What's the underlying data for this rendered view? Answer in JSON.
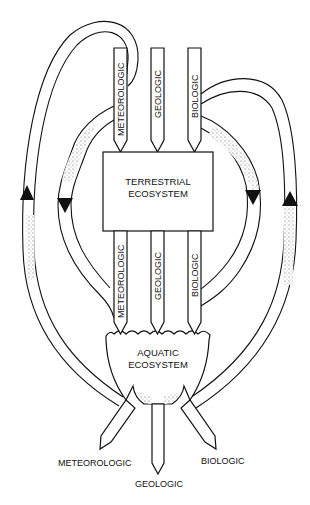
{
  "diagram": {
    "type": "ecosystem-flow-diagram",
    "colors": {
      "line": "#111111",
      "background": "#ffffff",
      "stipple": "#555555"
    },
    "terrestrial": {
      "label_line1": "TERRESTRIAL",
      "label_line2": "ECOSYSTEM",
      "inputs": [
        "METEOROLOGIC",
        "GEOLOGIC",
        "BIOLOGIC"
      ],
      "outputs": [
        "METEOROLOGIC",
        "GEOLOGIC",
        "BIOLOGIC"
      ]
    },
    "aquatic": {
      "label_line1": "AQUATIC",
      "label_line2": "ECOSYSTEM",
      "outputs": [
        "METEOROLOGIC",
        "GEOLOGIC",
        "BIOLOGIC"
      ]
    },
    "flows": [
      {
        "name": "left-outer-loop",
        "direction": "up",
        "from": "aquatic",
        "to": "terrestrial-meteorologic-input"
      },
      {
        "name": "left-inner-loop",
        "direction": "down",
        "from": "terrestrial-meteorologic-input",
        "to": "aquatic"
      },
      {
        "name": "right-inner-loop",
        "direction": "down",
        "from": "terrestrial-biologic-input",
        "to": "aquatic"
      },
      {
        "name": "right-outer-loop",
        "direction": "up",
        "from": "aquatic",
        "to": "terrestrial-biologic-input"
      }
    ]
  }
}
